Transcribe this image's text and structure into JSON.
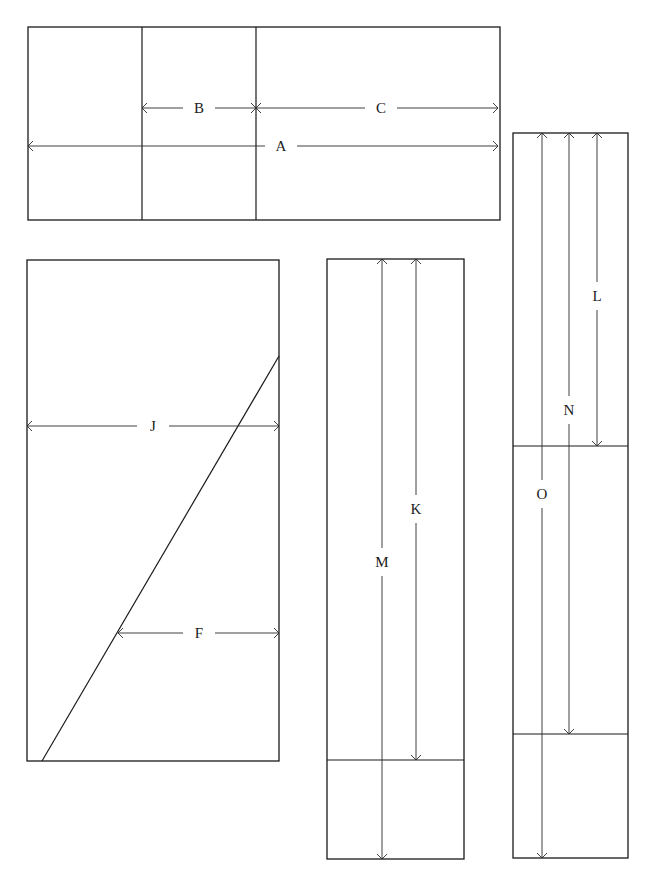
{
  "diagram": {
    "background": "#ffffff",
    "stroke_color": "#1a1a1a",
    "panels": [
      {
        "id": "panel-top",
        "rect": [
          28,
          27,
          472,
          193
        ],
        "dividers": [
          {
            "x1": 142,
            "y1": 27,
            "x2": 142,
            "y2": 220
          },
          {
            "x1": 256,
            "y1": 27,
            "x2": 256,
            "y2": 220
          }
        ],
        "dimensions": [
          {
            "label": "B",
            "orient": "h",
            "from": 142,
            "to": 256,
            "at": 108,
            "label_pos": 199
          },
          {
            "label": "C",
            "orient": "h",
            "from": 256,
            "to": 498,
            "at": 108,
            "label_pos": 381
          },
          {
            "label": "A",
            "orient": "h",
            "from": 28,
            "to": 498,
            "at": 146,
            "label_pos": 281
          }
        ]
      },
      {
        "id": "panel-diagonal",
        "rect": [
          27,
          260,
          252,
          501
        ],
        "diagonal": {
          "x1": 42,
          "y1": 761,
          "x2": 279,
          "y2": 356
        },
        "dimensions": [
          {
            "label": "J",
            "orient": "h",
            "from": 27,
            "to": 279,
            "at": 426,
            "label_pos": 153
          },
          {
            "label": "F",
            "orient": "h",
            "from": 118,
            "to": 279,
            "at": 633,
            "label_pos": 199
          }
        ]
      },
      {
        "id": "panel-middle",
        "rect": [
          327,
          259,
          137,
          600
        ],
        "dividers": [
          {
            "x1": 327,
            "y1": 760,
            "x2": 464,
            "y2": 760
          }
        ],
        "dimensions": [
          {
            "label": "K",
            "orient": "v",
            "from": 259,
            "to": 760,
            "at": 416,
            "label_pos": 509
          },
          {
            "label": "M",
            "orient": "v",
            "from": 259,
            "to": 859,
            "at": 382,
            "label_pos": 562
          }
        ]
      },
      {
        "id": "panel-right",
        "rect": [
          513,
          133,
          115,
          725
        ],
        "dividers": [
          {
            "x1": 513,
            "y1": 446,
            "x2": 628,
            "y2": 446
          },
          {
            "x1": 513,
            "y1": 734,
            "x2": 628,
            "y2": 734
          }
        ],
        "dimensions": [
          {
            "label": "L",
            "orient": "v",
            "from": 133,
            "to": 446,
            "at": 597,
            "label_pos": 296
          },
          {
            "label": "N",
            "orient": "v",
            "from": 133,
            "to": 734,
            "at": 569,
            "label_pos": 410
          },
          {
            "label": "O",
            "orient": "v",
            "from": 133,
            "to": 858,
            "at": 542,
            "label_pos": 494
          }
        ]
      }
    ]
  }
}
